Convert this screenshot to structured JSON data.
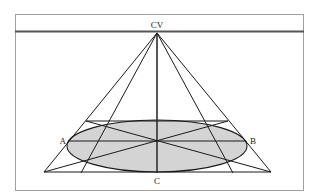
{
  "diagram": {
    "type": "one-point perspective construction of a circle (ellipse) in a square",
    "labels": {
      "vanishing_point": "CV",
      "left_point": "A",
      "right_point": "B",
      "bottom_point": "C"
    },
    "colors": {
      "line": "#1a1a1a",
      "horizon": "#555555",
      "ellipse_fill": "#d4d4d4",
      "frame": "#9a9a9a",
      "background": "#ffffff"
    }
  }
}
